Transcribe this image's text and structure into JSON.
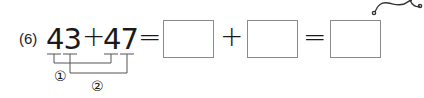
{
  "problem": {
    "number_label": "(6)",
    "first_addend": "43",
    "plus_sign": "+",
    "second_addend": "47",
    "equals_sign": "=",
    "answer_boxes": [
      {
        "value": ""
      },
      {
        "value": ""
      },
      {
        "value": ""
      }
    ],
    "box_plus_sign": "+",
    "box_equals_sign": "=",
    "bracket_labels": [
      "①",
      "②"
    ]
  },
  "colors": {
    "text": "#1a1a1a",
    "box_border": "#8a8a8a",
    "bracket_lines": "#555555"
  }
}
